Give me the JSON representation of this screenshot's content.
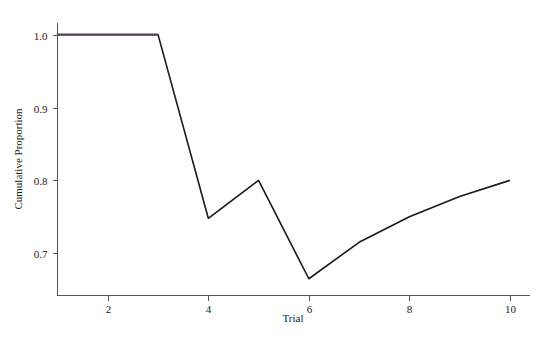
{
  "chart_data": {
    "type": "line",
    "title": "",
    "xlabel": "Trial",
    "ylabel": "Cumulative Proportion",
    "x": [
      1,
      2,
      3,
      4,
      5,
      6,
      7,
      8,
      9,
      10
    ],
    "series": [
      {
        "name": "Cumulative Proportion",
        "values": [
          1.0,
          1.0,
          1.0,
          0.748,
          0.8,
          0.665,
          0.715,
          0.75,
          0.778,
          0.8
        ],
        "color": "#1a1a1a",
        "highlight_color": "#5c3a5e",
        "highlight_from_x": 1,
        "highlight_to_x": 3
      }
    ],
    "xlim": [
      1.0,
      10.4
    ],
    "ylim": [
      0.642,
      1.016
    ],
    "xticks": [
      2,
      4,
      6,
      8,
      10
    ],
    "xtick_labels": [
      "2",
      "4",
      "6",
      "8",
      "10"
    ],
    "yticks": [
      0.7,
      0.8,
      0.9,
      1.0
    ],
    "ytick_labels": [
      "0.7",
      "0.8",
      "0.9",
      "1.0"
    ],
    "grid": false,
    "legend": "none",
    "annotations": []
  },
  "axis": {
    "x_title": "Trial",
    "y_title": "Cumulative Proportion"
  },
  "ticks": {
    "x": [
      "2",
      "4",
      "6",
      "8",
      "10"
    ],
    "y": [
      "0.7",
      "0.8",
      "0.9",
      "1.0"
    ]
  },
  "colors": {
    "background": "#ffffff",
    "axis": "#555555",
    "line": "#1a1a1a",
    "line_highlight": "#5c3a5e",
    "text": "#1a1a1a"
  }
}
